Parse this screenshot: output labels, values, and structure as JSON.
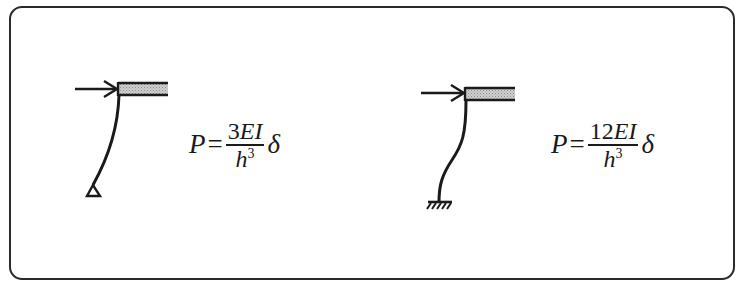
{
  "figure": {
    "type": "structural-diagram",
    "panels": [
      {
        "id": "pinned-base",
        "support": "pin",
        "load_label": "P",
        "formula": {
          "lhs": "P",
          "equals": "=",
          "numerator_coef": "3",
          "numerator_vars": "EI",
          "denominator_base": "h",
          "denominator_exp": "3",
          "trailing": "δ"
        }
      },
      {
        "id": "fixed-base",
        "support": "fixed",
        "load_label": "P",
        "formula": {
          "lhs": "P",
          "equals": "=",
          "numerator_coef": "12",
          "numerator_vars": "EI",
          "denominator_base": "h",
          "denominator_exp": "3",
          "trailing": "δ"
        }
      }
    ],
    "colors": {
      "line": "#1a1a1a",
      "beam_fill": "#bdbdbd",
      "frame_border": "#2a2a2a",
      "background": "#ffffff"
    }
  }
}
